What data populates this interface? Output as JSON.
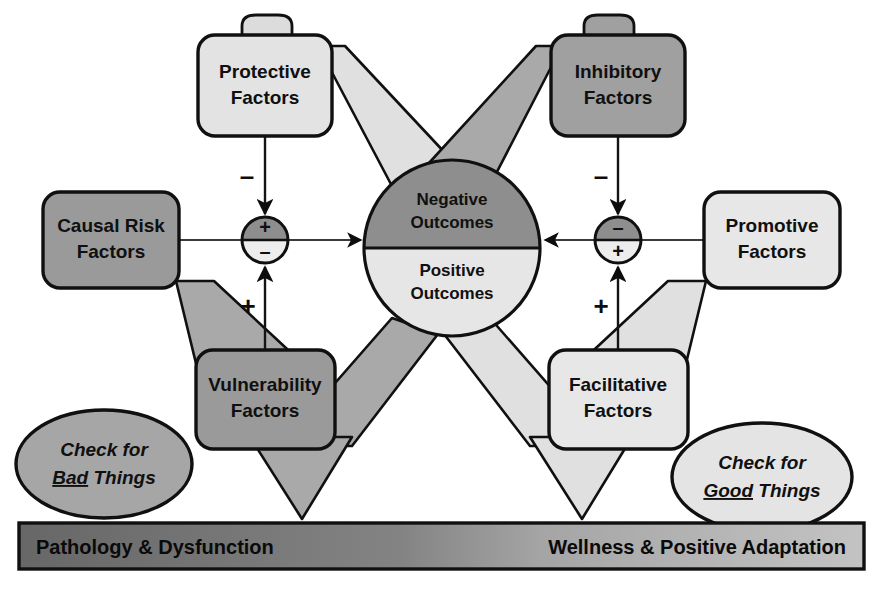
{
  "diagram": {
    "colors": {
      "dark_gray": "#8a8a8a",
      "mid_gray": "#a8a8a8",
      "light_gray": "#e2e2e2",
      "band_light": "#e0e0e0",
      "band_mid": "#a9a9a9",
      "outline": "#0d0d0d",
      "banner_left": "#6f6f6f",
      "banner_right": "#bdbdbd",
      "text": "#101010"
    },
    "boxes": [
      {
        "id": "protective",
        "label_line1": "Protective",
        "label_line2": "Factors",
        "tone": "light"
      },
      {
        "id": "inhibitory",
        "label_line1": "Inhibitory",
        "label_line2": "Factors",
        "tone": "dark"
      },
      {
        "id": "causal_risk",
        "label_line1": "Causal Risk",
        "label_line2": "Factors",
        "tone": "dark"
      },
      {
        "id": "promotive",
        "label_line1": "Promotive",
        "label_line2": "Factors",
        "tone": "light"
      },
      {
        "id": "vulnerability",
        "label_line1": "Vulnerability",
        "label_line2": "Factors",
        "tone": "dark"
      },
      {
        "id": "facilitative",
        "label_line1": "Facilitative",
        "label_line2": "Factors",
        "tone": "light"
      }
    ],
    "outcome_circle": {
      "top_label_line1": "Negative",
      "top_label_line2": "Outcomes",
      "bottom_label_line1": "Positive",
      "bottom_label_line2": "Outcomes",
      "top_tone": "dark",
      "bottom_tone": "light"
    },
    "junctions": [
      {
        "id": "left-junction",
        "top_sign": "+",
        "bottom_sign": "–"
      },
      {
        "id": "right-junction",
        "top_sign": "–",
        "bottom_sign": "+"
      }
    ],
    "edge_signs": [
      {
        "id": "protective-minus",
        "sign": "–"
      },
      {
        "id": "inhibitory-minus",
        "sign": "–"
      },
      {
        "id": "vulnerability-plus",
        "sign": "+"
      },
      {
        "id": "facilitative-plus",
        "sign": "+"
      }
    ],
    "ellipses": [
      {
        "id": "check-bad",
        "line1": "Check for",
        "emph": "Bad",
        "rest": " Things"
      },
      {
        "id": "check-good",
        "line1": "Check for",
        "emph": "Good",
        "rest": " Things"
      }
    ],
    "banner": {
      "left_label": "Pathology & Dysfunction",
      "right_label": "Wellness & Positive Adaptation"
    }
  }
}
